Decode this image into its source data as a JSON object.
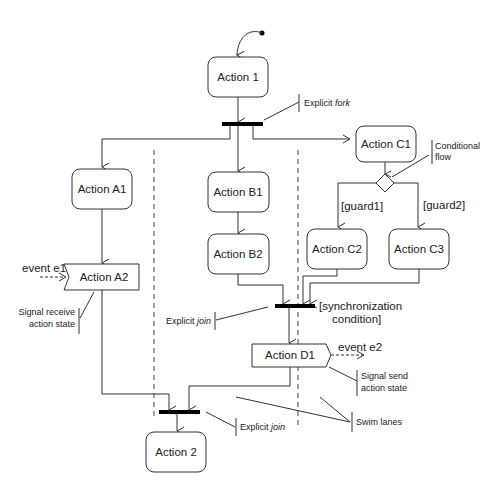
{
  "diagram": {
    "type": "UML activity diagram",
    "nodes": {
      "action1": "Action 1",
      "actionA1": "Action A1",
      "actionA2": "Action A2",
      "actionB1": "Action B1",
      "actionB2": "Action B2",
      "actionC1": "Action C1",
      "actionC2": "Action C2",
      "actionC3": "Action C3",
      "actionD1": "Action D1",
      "action2": "Action 2"
    },
    "guards": {
      "guard1": "[guard1]",
      "guard2": "[guard2]",
      "sync_line1": "[synchronization",
      "sync_line2": "condition]"
    },
    "events": {
      "e1": "event e1",
      "e2": "event e2"
    },
    "annotations": {
      "fork_prefix": "Explicit ",
      "fork_italic": "fork",
      "join1_prefix": "Explicit ",
      "join1_italic": "join",
      "join2_prefix": "Explicit ",
      "join2_italic": "join",
      "conditional_line1": "Conditional",
      "conditional_line2": "flow",
      "signal_receive_line1": "Signal receive",
      "signal_receive_line2": "action state",
      "signal_send_line1": "Signal send",
      "signal_send_line2": "action state",
      "swim_lanes": "Swim lanes"
    }
  }
}
